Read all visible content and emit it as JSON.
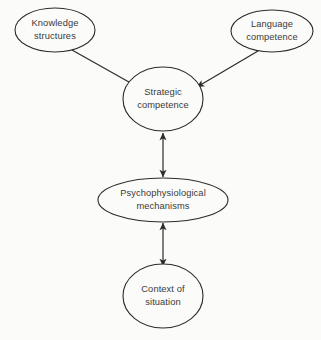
{
  "diagram": {
    "background_color": "#fbfbf9",
    "stroke_color": "#2b2b2b",
    "text_color": "#3a3a3a",
    "nodes": [
      {
        "id": "knowledge-structures",
        "shape": "ellipse",
        "line1": "Knowledge",
        "line2": "structures",
        "cx": 55,
        "cy": 30,
        "rx": 40,
        "ry": 22
      },
      {
        "id": "language-competence",
        "shape": "ellipse",
        "line1": "Language",
        "line2": "competence",
        "cx": 272,
        "cy": 31,
        "rx": 41,
        "ry": 21
      },
      {
        "id": "strategic-competence",
        "shape": "ellipse",
        "line1": "Strategic",
        "line2": "competence",
        "cx": 163,
        "cy": 99,
        "rx": 40,
        "ry": 32
      },
      {
        "id": "psychophysiological-mechanisms",
        "shape": "ellipse",
        "line1": "Psychophysiological",
        "line2": "mechanisms",
        "cx": 163,
        "cy": 200,
        "rx": 65,
        "ry": 22
      },
      {
        "id": "context-of-situation",
        "shape": "ellipse",
        "line1": "Context of",
        "line2": "situation",
        "cx": 163,
        "cy": 296,
        "rx": 40,
        "ry": 32
      }
    ],
    "edges": [
      {
        "id": "knowledge-to-strategic",
        "from": "knowledge-structures",
        "to": "strategic-competence",
        "arrowheads": "single",
        "x1": 72,
        "y1": 50,
        "x2": 136,
        "y2": 86
      },
      {
        "id": "language-to-strategic",
        "from": "language-competence",
        "to": "strategic-competence",
        "arrowheads": "single",
        "x1": 258,
        "y1": 51,
        "x2": 197,
        "y2": 87
      },
      {
        "id": "strategic-to-psychophysiological",
        "from": "strategic-competence",
        "to": "psychophysiological-mechanisms",
        "arrowheads": "double",
        "x1": 163,
        "y1": 133,
        "x2": 163,
        "y2": 177
      },
      {
        "id": "psychophysiological-to-context",
        "from": "psychophysiological-mechanisms",
        "to": "context-of-situation",
        "arrowheads": "double",
        "x1": 163,
        "y1": 223,
        "x2": 163,
        "y2": 266
      }
    ]
  }
}
